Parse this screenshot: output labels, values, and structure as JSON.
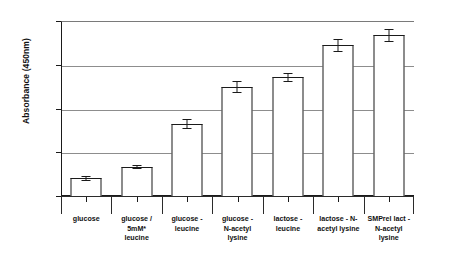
{
  "chart_data": {
    "type": "bar",
    "title": "",
    "xlabel": "",
    "ylabel": "Absorbance (450nm)",
    "ylim": [
      0.0,
      0.4
    ],
    "ytick_labels": [
      "0.40",
      "0.30",
      "0.20",
      "0.10",
      "0.00"
    ],
    "ytick_values": [
      0.4,
      0.3,
      0.2,
      0.1,
      0.0
    ],
    "grid": true,
    "grid_axis": "y",
    "legend": false,
    "bar_fill_color": "#ffffff",
    "bar_edge_color": "#1a1a1a",
    "categories": [
      "glucose",
      "glucose / 5mM* leucine",
      "glucose - leucine",
      "glucose - N-acetyl lysine",
      "lactose - leucine",
      "lactose - N-acetyl lysine",
      "SMPrel lact - N-acetyl lysine"
    ],
    "category_lines": [
      [
        "glucose"
      ],
      [
        "glucose /",
        "5mM*",
        "leucine"
      ],
      [
        "glucose -",
        "leucine"
      ],
      [
        "glucose -",
        "N-acetyl",
        "lysine"
      ],
      [
        "lactose -",
        "leucine"
      ],
      [
        "lactose - N-",
        "acetyl lysine"
      ],
      [
        "SMPrel lact -",
        "N-acetyl",
        "lysine"
      ]
    ],
    "values": [
      0.041,
      0.067,
      0.165,
      0.25,
      0.272,
      0.345,
      0.368
    ],
    "errors": [
      0.004,
      0.003,
      0.01,
      0.012,
      0.01,
      0.014,
      0.013
    ]
  }
}
